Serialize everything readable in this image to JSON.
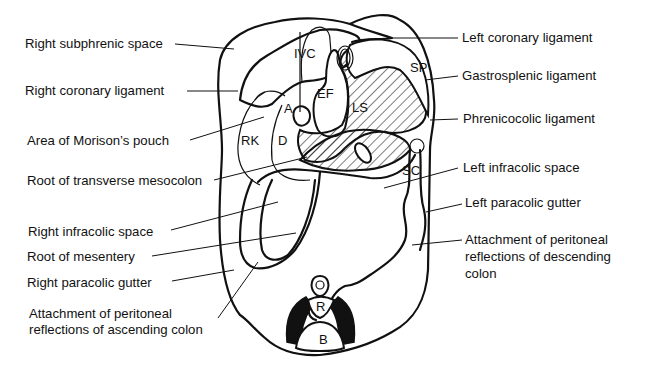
{
  "figure": {
    "type": "anatomical-diagram",
    "left_labels": [
      {
        "id": "right-subphrenic-space",
        "lines": [
          "Right subphrenic space"
        ]
      },
      {
        "id": "right-coronary-ligament",
        "lines": [
          "Right coronary ligament"
        ]
      },
      {
        "id": "area-of-morisons-pouch",
        "lines": [
          "Area of Morison’s pouch"
        ]
      },
      {
        "id": "root-of-transverse-mesocolon",
        "lines": [
          "Root of transverse mesocolon"
        ]
      },
      {
        "id": "right-infracolic-space",
        "lines": [
          "Right infracolic space"
        ]
      },
      {
        "id": "root-of-mesentery",
        "lines": [
          "Root of mesentery"
        ]
      },
      {
        "id": "right-paracolic-gutter",
        "lines": [
          "Right paracolic gutter"
        ]
      },
      {
        "id": "attachment-ascending-colon",
        "lines": [
          "Attachment of peritoneal",
          "reflections of ascending colon"
        ]
      }
    ],
    "right_labels": [
      {
        "id": "left-coronary-ligament",
        "lines": [
          "Left coronary ligament"
        ]
      },
      {
        "id": "gastrosplenic-ligament",
        "lines": [
          "Gastrosplenic ligament"
        ]
      },
      {
        "id": "phrenicocolic-ligament",
        "lines": [
          "Phrenicocolic ligament"
        ]
      },
      {
        "id": "left-infracolic-space",
        "lines": [
          "Left infracolic space"
        ]
      },
      {
        "id": "left-paracolic-gutter",
        "lines": [
          "Left paracolic gutter"
        ]
      },
      {
        "id": "attachment-descending-colon",
        "lines": [
          "Attachment of peritoneal",
          "reflections of descending",
          "colon"
        ]
      }
    ],
    "organ_labels": {
      "ivc": "IVC",
      "ef": "EF",
      "a": "A",
      "ls": "LS",
      "sp": "SP",
      "rk": "RK",
      "d": "D",
      "sc": "SC",
      "r": "R",
      "b": "B"
    }
  }
}
